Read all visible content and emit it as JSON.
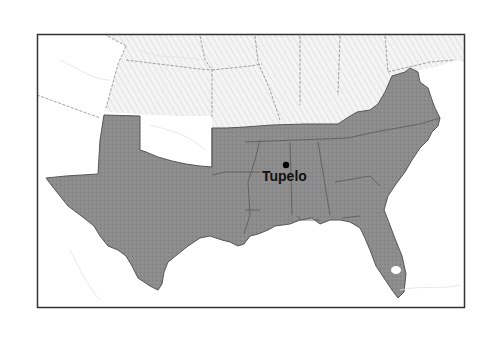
{
  "map": {
    "title": "",
    "highlight_region": "Southern United States (Confederate states)",
    "colors": {
      "background": "#ffffff",
      "frame": "#333333",
      "highlight_fill": "#8a8a8a",
      "highlight_border": "#555555",
      "hatched_fill": "#f2f2f2",
      "hatch_line": "#d6d6d6",
      "unshaded_fill": "#ffffff",
      "state_border": "#9a9a9a",
      "river": "#dcdcdc",
      "marker": "#000000"
    },
    "markers": [
      {
        "name": "Tupelo",
        "label": "Tupelo",
        "x": 286,
        "y": 165
      }
    ]
  }
}
